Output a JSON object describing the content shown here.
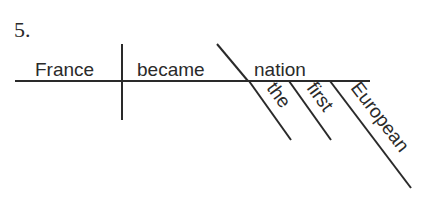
{
  "diagram": {
    "number": "5.",
    "subject": "France",
    "verb": "became",
    "complement": "nation",
    "modifiers": [
      "the",
      "first",
      "European"
    ]
  }
}
